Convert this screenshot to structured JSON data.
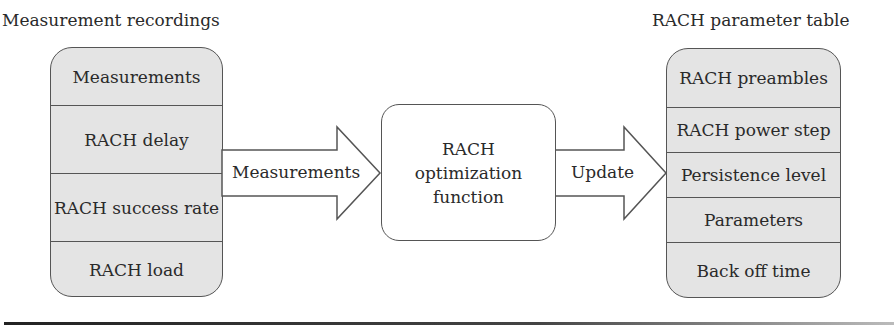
{
  "left_panel": {
    "title": "Measurement recordings",
    "items": [
      {
        "label": "Measurements"
      },
      {
        "label": "RACH delay"
      },
      {
        "label": "RACH success rate"
      },
      {
        "label": "RACH load"
      }
    ]
  },
  "arrow_in": {
    "label": "Measurements"
  },
  "function_box": {
    "lines": [
      "RACH",
      "optimization",
      "function"
    ]
  },
  "arrow_out": {
    "label": "Update"
  },
  "right_panel": {
    "title": "RACH parameter table",
    "items": [
      {
        "label": "RACH preambles"
      },
      {
        "label": "RACH power step"
      },
      {
        "label": "Persistence level"
      },
      {
        "label": "Parameters"
      },
      {
        "label": "Back off time"
      }
    ]
  },
  "colors": {
    "box_fill": "#e4e4e4",
    "stroke": "#555555",
    "text": "#2a2a2a"
  }
}
